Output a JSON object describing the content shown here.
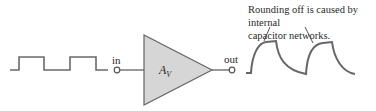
{
  "diagram": {
    "type": "amplifier-signal-diagram",
    "input_label": "in",
    "output_label": "out",
    "amplifier_label": "A",
    "amplifier_subscript": "V",
    "annotation_line1": "Rounding off is caused by internal",
    "annotation_line2": "capacitor networks.",
    "input_waveform": "square-wave",
    "output_waveform": "rounded-square-wave",
    "colors": {
      "stroke": "#555555",
      "triangle_fill": "#d6d6d6",
      "text": "#2a2a2a"
    }
  }
}
